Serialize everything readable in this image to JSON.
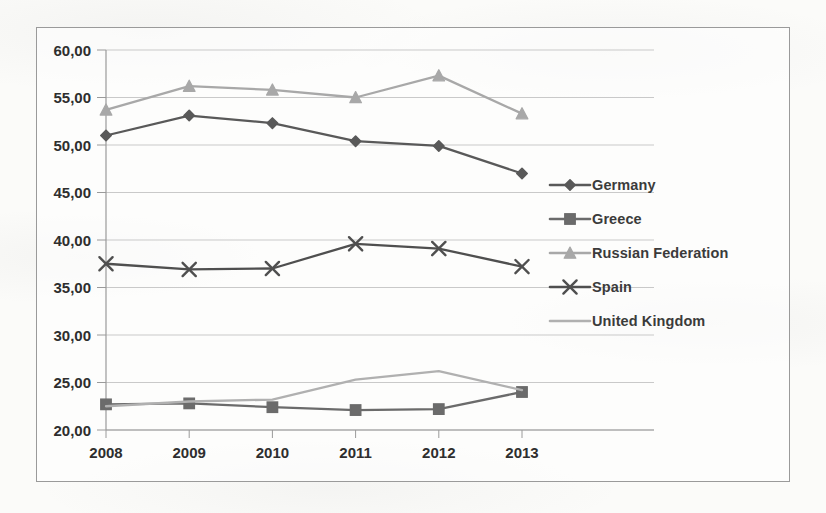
{
  "chart_data": {
    "type": "line",
    "title": "",
    "subtitle": "",
    "xlabel": "",
    "ylabel": "",
    "categories": [
      "2008",
      "2009",
      "2010",
      "2011",
      "2012",
      "2013"
    ],
    "x": [
      2008,
      2009,
      2010,
      2011,
      2012,
      2013
    ],
    "ylim": [
      20.0,
      60.0
    ],
    "ytick_values": [
      20.0,
      25.0,
      30.0,
      35.0,
      40.0,
      45.0,
      50.0,
      55.0,
      60.0
    ],
    "ytick_labels": [
      "20,00",
      "25,00",
      "30,00",
      "35,00",
      "40,00",
      "45,00",
      "50,00",
      "55,00",
      "60,00"
    ],
    "decimal_separator": ",",
    "grid": "horizontal",
    "legend_position": "right",
    "series": [
      {
        "name": "Germany",
        "marker": "diamond",
        "color": "#595959",
        "values": [
          51.0,
          53.1,
          52.3,
          50.4,
          49.9,
          47.0
        ]
      },
      {
        "name": "Greece",
        "marker": "square",
        "color": "#6b6b6b",
        "values": [
          22.7,
          22.8,
          22.4,
          22.1,
          22.2,
          24.0
        ]
      },
      {
        "name": "Russian Federation",
        "marker": "triangle",
        "color": "#a8a8a8",
        "values": [
          53.7,
          56.2,
          55.8,
          55.0,
          57.3,
          53.3
        ]
      },
      {
        "name": "Spain",
        "marker": "cross",
        "color": "#4f4f4f",
        "values": [
          37.5,
          36.9,
          37.0,
          39.6,
          39.1,
          37.2
        ]
      },
      {
        "name": "United Kingdom",
        "marker": "line",
        "color": "#b0b0b0",
        "values": [
          22.5,
          23.0,
          23.2,
          25.3,
          26.2,
          24.2
        ]
      }
    ]
  },
  "legend": {
    "items": [
      {
        "label": "Germany"
      },
      {
        "label": "Greece"
      },
      {
        "label": "Russian Federation"
      },
      {
        "label": "Spain"
      },
      {
        "label": "United Kingdom"
      }
    ]
  },
  "colors": {
    "frame": "#9a9a9a",
    "gridline": "#c9c9c9",
    "axis": "#9a9a9a",
    "tick_text": "#2e2e2e",
    "background": "#fbfbf9"
  }
}
